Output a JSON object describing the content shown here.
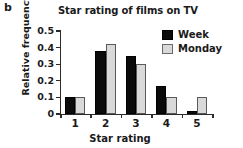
{
  "panel": {
    "label": "b"
  },
  "legend": {
    "position": "top-right",
    "entries": [
      {
        "label": "Week",
        "color": "#0b0b0b"
      },
      {
        "label": "Monday",
        "color": "#d9d9d9"
      }
    ]
  },
  "chart_data": {
    "type": "bar",
    "title": "Star rating of films on TV",
    "xlabel": "Star rating",
    "ylabel": "Relative frequency",
    "categories": [
      "1",
      "2",
      "3",
      "4",
      "5"
    ],
    "series": [
      {
        "name": "Week",
        "color": "#0b0b0b",
        "values": [
          0.1,
          0.38,
          0.35,
          0.17,
          0.02
        ]
      },
      {
        "name": "Monday",
        "color": "#d9d9d9",
        "values": [
          0.1,
          0.42,
          0.3,
          0.1,
          0.1
        ]
      }
    ],
    "ylim": [
      0,
      0.5
    ],
    "yticks": [
      0,
      0.1,
      0.2,
      0.3,
      0.4,
      0.5
    ],
    "ytick_labels": [
      "0",
      "0.1",
      "0.2",
      "0.3",
      "0.4",
      "0.5"
    ],
    "grid": false,
    "legend_position": "top-right"
  }
}
